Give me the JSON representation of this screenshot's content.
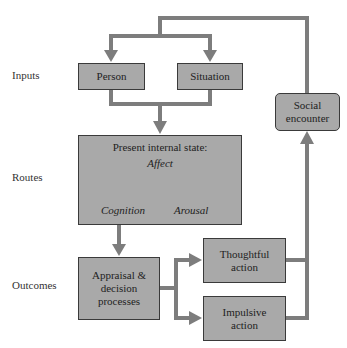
{
  "row_labels": {
    "inputs": "Inputs",
    "routes": "Routes",
    "outcomes": "Outcomes"
  },
  "nodes": {
    "person": "Person",
    "situation": "Situation",
    "internal_state": {
      "title": "Present internal state:",
      "affect": "Affect",
      "cognition": "Cognition",
      "arousal": "Arousal"
    },
    "appraisal": [
      "Appraisal &",
      "decision",
      "processes"
    ],
    "thoughtful": [
      "Thoughtful",
      "action"
    ],
    "impulsive": [
      "Impulsive",
      "action"
    ],
    "social": [
      "Social",
      "encounter"
    ]
  },
  "colors": {
    "box_fill": "#a9a9a9",
    "box_border": "#3a3a3a",
    "connector": "#7d7d7d"
  }
}
